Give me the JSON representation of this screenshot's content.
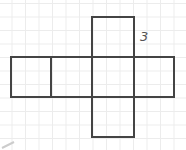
{
  "diagram": {
    "type": "cube-net",
    "label": "3",
    "stroke_color": "#444444",
    "grid_color": "#ececec",
    "faces": [
      {
        "name": "top",
        "x": 92,
        "y": 17,
        "w": 42,
        "h": 40
      },
      {
        "name": "left-1",
        "x": 11,
        "y": 57,
        "w": 40,
        "h": 40
      },
      {
        "name": "left-2",
        "x": 51,
        "y": 57,
        "w": 41,
        "h": 40
      },
      {
        "name": "center",
        "x": 92,
        "y": 57,
        "w": 42,
        "h": 40
      },
      {
        "name": "right",
        "x": 134,
        "y": 57,
        "w": 40,
        "h": 40
      },
      {
        "name": "bottom",
        "x": 92,
        "y": 97,
        "w": 42,
        "h": 40
      }
    ]
  }
}
